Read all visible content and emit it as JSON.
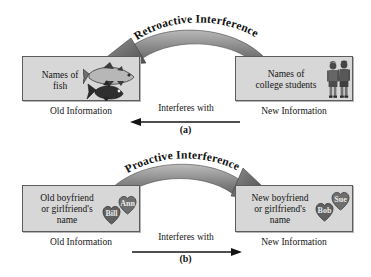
{
  "figure": {
    "background_color": "#ffffff",
    "box_fill_color": "#d7d7d7",
    "box_border_color": "#5c5c5c",
    "arrow_color": "#6e6e6e",
    "text_color": "#141414"
  },
  "panels": [
    {
      "letter": "(a)",
      "curve_label": "Retroactive Interference",
      "curve_direction": "right-to-left",
      "old": {
        "box_text": "Names of\nfish",
        "caption": "Old Information",
        "art": "fish-illustration"
      },
      "new": {
        "box_text": "Names of\ncollege students",
        "caption": "New Information",
        "art": "college-students-illustration"
      },
      "interferes_label": "Interferes with",
      "interferes_direction": "left"
    },
    {
      "letter": "(b)",
      "curve_label": "Proactive Interference",
      "curve_direction": "left-to-right",
      "old": {
        "box_text": "Old boyfriend\nor girlfriend's\nname",
        "caption": "Old Information",
        "art": "hearts-illustration",
        "heart_names": [
          "Ann",
          "Bill"
        ]
      },
      "new": {
        "box_text": "New boyfriend\nor girlfriend's\nname",
        "caption": "New Information",
        "art": "hearts-illustration",
        "heart_names": [
          "Sue",
          "Bob"
        ]
      },
      "interferes_label": "Interferes with",
      "interferes_direction": "right"
    }
  ]
}
